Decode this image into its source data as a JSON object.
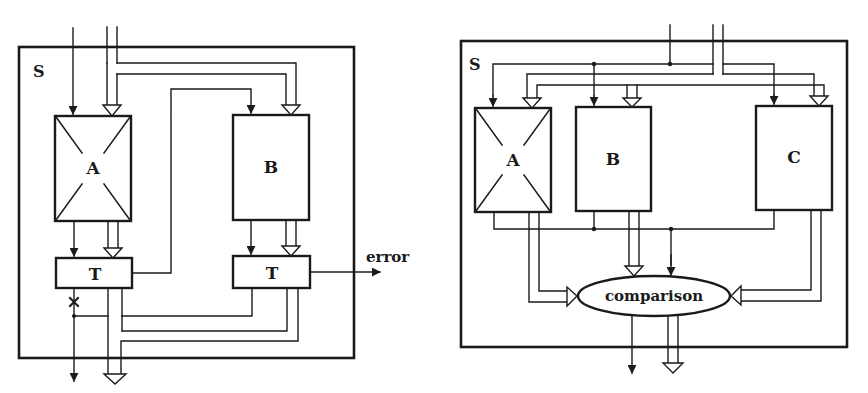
{
  "colors": {
    "ink": "#1a1a1a",
    "background": "#ffffff"
  },
  "left_diagram": {
    "system_label": "S",
    "modules": [
      {
        "id": "A",
        "label": "A",
        "faulty": true
      },
      {
        "id": "B",
        "label": "B",
        "faulty": false
      }
    ],
    "testers": [
      {
        "id": "T1",
        "label": "T"
      },
      {
        "id": "T2",
        "label": "T"
      }
    ],
    "outputs": {
      "error_label": "error"
    }
  },
  "right_diagram": {
    "system_label": "S",
    "modules": [
      {
        "id": "A",
        "label": "A",
        "faulty": true
      },
      {
        "id": "B",
        "label": "B",
        "faulty": false
      },
      {
        "id": "C",
        "label": "C",
        "faulty": false
      }
    ],
    "voter": {
      "label": "comparison"
    }
  }
}
